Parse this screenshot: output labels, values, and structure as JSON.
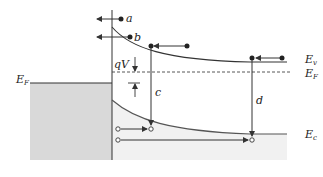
{
  "diagram": {
    "type": "band-diagram",
    "labels": {
      "a": "a",
      "b": "b",
      "c": "c",
      "d": "d",
      "qV": "qV",
      "EF_left": "E",
      "EF_left_sub": "F",
      "Ev": "E",
      "Ev_sub": "v",
      "EF_right": "E",
      "EF_right_sub": "F",
      "Ec": "E",
      "Ec_sub": "c"
    },
    "colors": {
      "line": "#333333",
      "metal_fill": "#d9d9d9",
      "semiconductor_fill": "#f1f1f1",
      "dashed": "#444444"
    },
    "transitions": [
      {
        "id": "a",
        "kind": "electron",
        "direction": "left",
        "note": "electron emission over barrier to metal"
      },
      {
        "id": "b",
        "kind": "electron",
        "direction": "left",
        "note": "tunneling through barrier"
      },
      {
        "id": "c",
        "kind": "recombination",
        "direction": "down",
        "note": "recombination in depletion region"
      },
      {
        "id": "d",
        "kind": "recombination",
        "direction": "down",
        "note": "recombination in neutral region"
      }
    ]
  }
}
